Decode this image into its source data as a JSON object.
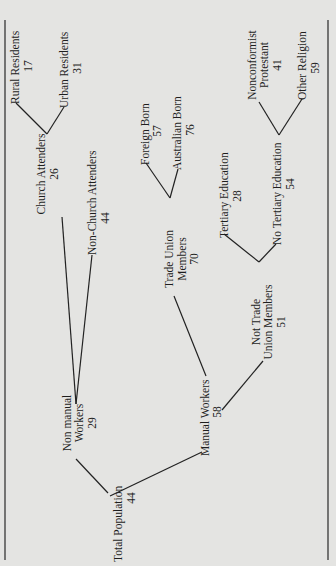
{
  "diagram": {
    "type": "tree",
    "orientation": "rotated-90-ccw",
    "nodes": {
      "total": {
        "label": "Total  Population",
        "value": "44"
      },
      "nonmanual": {
        "label1": "Non manual",
        "label2": "Workers",
        "value": "29"
      },
      "manual": {
        "label": "Manual  Workers",
        "value": "58"
      },
      "church": {
        "label": "Church Attenders",
        "value": "26"
      },
      "nonchurch": {
        "label": "Non-Church  Attenders",
        "value": "44"
      },
      "rural": {
        "label": "Rural Residents",
        "value": "17"
      },
      "urban": {
        "label": "Urban Residents",
        "value": "31"
      },
      "union": {
        "label1": "Trade Union",
        "label2": "Members",
        "value": "70"
      },
      "nonunion": {
        "label1": "Not Trade",
        "label2": "Union Members",
        "value": "51"
      },
      "foreign": {
        "label": "Foreign Born",
        "value": "57"
      },
      "australian": {
        "label": "Australian Born",
        "value": "76"
      },
      "tertiary": {
        "label": "Tertiary Education",
        "value": "28"
      },
      "notertiary": {
        "label": "No Tertiary Education",
        "value": "54"
      },
      "nonconformist": {
        "label1": "Nonconformist",
        "label2": "Protestant",
        "value": "41"
      },
      "otherreligion": {
        "label": "Other Religion",
        "value": "59"
      }
    }
  }
}
